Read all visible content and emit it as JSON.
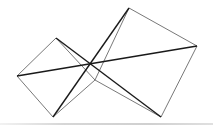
{
  "diagram": {
    "type": "geometric-figure",
    "colors": {
      "background": "#ffffff",
      "stroke": "#1a1a1a",
      "thin_stroke": "#555555",
      "rule": "#d4d4d4"
    },
    "points": {
      "A_left": [
        17,
        76
      ],
      "B_top_left": [
        56,
        38
      ],
      "C_bottom_left": [
        53,
        117
      ],
      "D_top_right": [
        129,
        8
      ],
      "E_right": [
        197,
        46
      ],
      "F_bottom_right": [
        161,
        117
      ],
      "O_center": [
        90,
        63
      ],
      "P_lower": [
        95,
        80
      ]
    },
    "thick_lines": [
      [
        "A_left",
        "E_right"
      ],
      [
        "B_top_left",
        "F_bottom_right"
      ],
      [
        "C_bottom_left",
        "D_top_right"
      ]
    ],
    "thin_lines": [
      [
        "A_left",
        "B_top_left"
      ],
      [
        "A_left",
        "C_bottom_left"
      ],
      [
        "D_top_right",
        "E_right"
      ],
      [
        "E_right",
        "F_bottom_right"
      ],
      [
        "B_top_left",
        "P_lower"
      ],
      [
        "P_lower",
        "C_bottom_left"
      ],
      [
        "P_lower",
        "F_bottom_right"
      ],
      [
        "P_lower",
        "D_top_right"
      ]
    ]
  }
}
